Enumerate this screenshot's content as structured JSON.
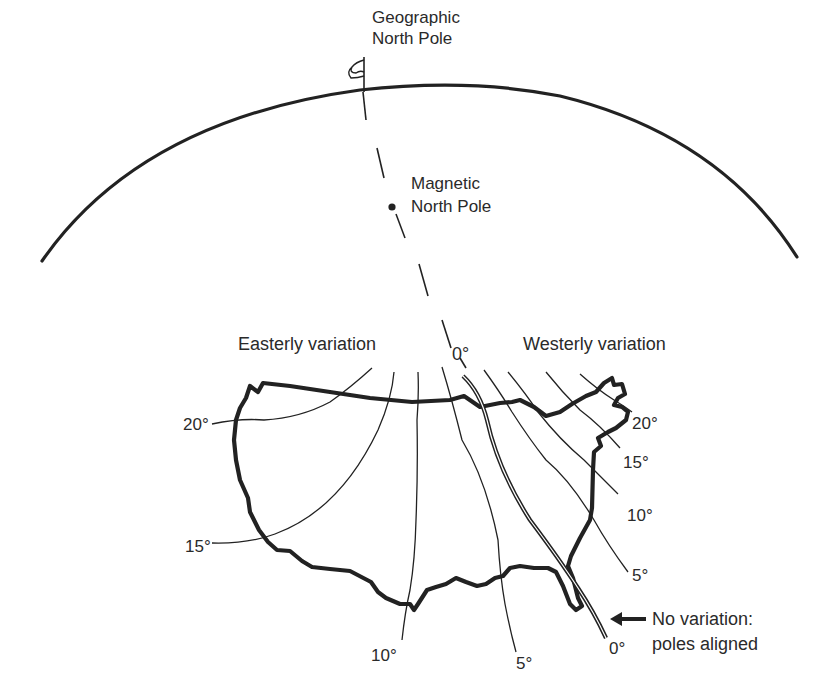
{
  "diagram": {
    "labels": {
      "geographic_pole": [
        "Geographic",
        "North Pole"
      ],
      "magnetic_pole": [
        "Magnetic",
        "North Pole"
      ],
      "easterly": "Easterly variation",
      "westerly": "Westerly variation",
      "agonic_top": "0°",
      "no_variation": [
        "No variation:",
        "poles aligned"
      ]
    },
    "isogonic_lines": [
      {
        "side": "easterly",
        "value": "20°"
      },
      {
        "side": "easterly",
        "value": "15°"
      },
      {
        "side": "easterly",
        "value": "10°"
      },
      {
        "side": "easterly",
        "value": "5°"
      },
      {
        "side": "agonic",
        "value": "0°"
      },
      {
        "side": "westerly",
        "value": "5°"
      },
      {
        "side": "westerly",
        "value": "10°"
      },
      {
        "side": "westerly",
        "value": "15°"
      },
      {
        "side": "westerly",
        "value": "20°"
      }
    ],
    "colors": {
      "ink": "#222222",
      "background": "#ffffff"
    }
  }
}
